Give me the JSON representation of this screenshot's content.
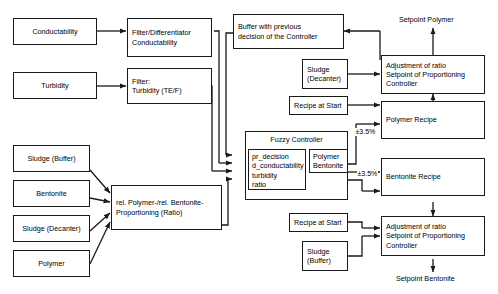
{
  "diagram": {
    "nodes": {
      "conductability": "Conductability",
      "turbidity": "Turbidity",
      "filter_diff_conductability": "Filter/Differentiator\nConductability",
      "filter_turbidity": "Filter:\nTurbidity (TE/F)",
      "sludge_buffer_left": "Sludge (Buffer)",
      "bentonite_left": "Bentonite",
      "sludge_decanter_left": "Sludge (Decanter)",
      "polymer_left": "Polymer",
      "ratio_block": "rel. Polymer-/rel. Bentonite-\nProportioning (Ratio)",
      "buffer_previous": "Buffer with previous\ndecision of the Controller",
      "fuzzy_controller": "Fuzzy Controller",
      "fc_inputs": [
        "pr_decision",
        "d_conductability",
        "turbidity",
        "ratio"
      ],
      "fc_output": "Polymer\nBentonite",
      "sludge_decanter_right": "Sludge\n(Decanter)",
      "recipe_at_start_top": "Recipe at Start",
      "recipe_at_start_bottom": "Recipe at Start",
      "sludge_buffer_right": "Sludge\n(Buffer)",
      "adjustment_polymer": "Adjustment of ratio\nSetpoint of Proportioning\nController",
      "polymer_recipe": "Polymer Recipe",
      "bentonite_recipe": "Bentonite Recipe",
      "adjustment_bentonite": "Adjustment of ratio\nSetpoint of Proportioning\nController"
    },
    "labels": {
      "setpoint_polymer": "Setpoint Polymer",
      "setpoint_bentonite": "Setpoint Bentonite",
      "tolerance_polymer": "±3.5%",
      "tolerance_bentonite": "±3.5%"
    },
    "colors": {
      "stroke": "#1a1a1a",
      "background": "#ffffff",
      "text": "#000000"
    }
  }
}
